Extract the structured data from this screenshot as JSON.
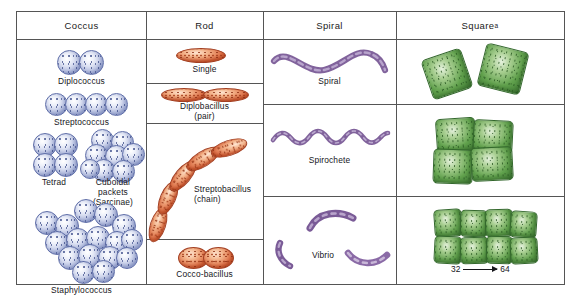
{
  "figure": {
    "columns": [
      {
        "id": "coccus",
        "header": "Coccus"
      },
      {
        "id": "rod",
        "header": "Rod"
      },
      {
        "id": "spiral",
        "header": "Spiral"
      },
      {
        "id": "square",
        "header": "Square",
        "superscript": "a"
      }
    ],
    "coccus_arrangements": [
      {
        "label": "Diplococcus",
        "cells": 2
      },
      {
        "label": "Streptococcus",
        "cells": 4
      },
      {
        "label": "Tetrad",
        "cells": 4
      },
      {
        "label": "Cuboidal packets",
        "label2": "(Sarcinae)",
        "cells": 8
      },
      {
        "label": "Staphylococcus",
        "cells": 16
      }
    ],
    "rod_arrangements": [
      {
        "label": "Single",
        "cells": 1
      },
      {
        "label": "Diplobacillus",
        "label2": "(pair)",
        "cells": 2
      },
      {
        "label": "Streptobacillus",
        "label2": "(chain)",
        "cells": 5
      },
      {
        "label": "Cocco-bacillus",
        "cells": 2
      }
    ],
    "spiral_arrangements": [
      {
        "label": "Spiral",
        "cells": 1
      },
      {
        "label": "Spirochete",
        "cells": 1
      },
      {
        "label": "Vibrio",
        "cells": 3
      }
    ],
    "square_arrangements": [
      {
        "label": "",
        "cells": 2
      },
      {
        "label": "",
        "cells": 4
      },
      {
        "label": "",
        "cells": 8
      }
    ],
    "square_annotation": {
      "from": "32",
      "to": "64"
    },
    "colors": {
      "coccus": "#8f9cd0",
      "rod": "#d9633a",
      "spiral": "#8d6ca8",
      "square": "#62a24e",
      "rule": "#555555",
      "text": "#16161b"
    }
  }
}
